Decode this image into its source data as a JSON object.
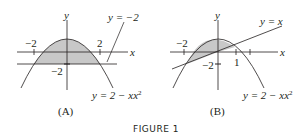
{
  "figure": {
    "caption": "FIGURE 1",
    "panels": [
      {
        "id": "A",
        "label": "(A)",
        "axis_x_label": "x",
        "axis_y_label": "y",
        "tick_labels": [
          "−2",
          "2",
          "−2"
        ],
        "curve_labels": [
          "y = −2",
          "y = 2 − x"
        ],
        "curve_sup": "2",
        "description": "Shaded region between y = 2 − x^2 and y = −2 for −2 ≤ x ≤ 2"
      },
      {
        "id": "B",
        "label": "(B)",
        "axis_x_label": "x",
        "axis_y_label": "y",
        "tick_labels": [
          "−2",
          "1",
          "−2"
        ],
        "curve_labels": [
          "y = x",
          "y = 2 − x"
        ],
        "curve_sup": "2",
        "description": "Shaded region between y = 2 − x^2 and y = x for −2 ≤ x ≤ 1"
      }
    ]
  },
  "colors": {
    "ink": "#231f20",
    "shade": "#c8c8c8"
  }
}
